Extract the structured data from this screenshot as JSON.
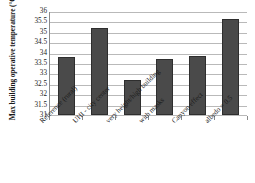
{
  "chart_data": {
    "type": "bar",
    "title": "",
    "xlabel": "",
    "ylabel": "Max building operative temperature (°C)",
    "categories": [
      "Reference (rural)",
      "UHI - city center",
      "very height/high building",
      "with masks",
      "Canyon effect",
      "albedo = 0.5"
    ],
    "values": [
      33.8,
      35.2,
      32.7,
      33.7,
      33.85,
      35.6
    ],
    "ylim": [
      31,
      36
    ],
    "ytick_step": 0.5,
    "yticks": [
      "36",
      "35.5",
      "35",
      "34.5",
      "34",
      "33.5",
      "33",
      "32.5",
      "32",
      "31.5",
      "31"
    ],
    "grid": true,
    "legend": false,
    "bar_color": "#4a4a4a",
    "grid_color": "#b9b9b9",
    "axis_color": "#8a8a8a"
  }
}
